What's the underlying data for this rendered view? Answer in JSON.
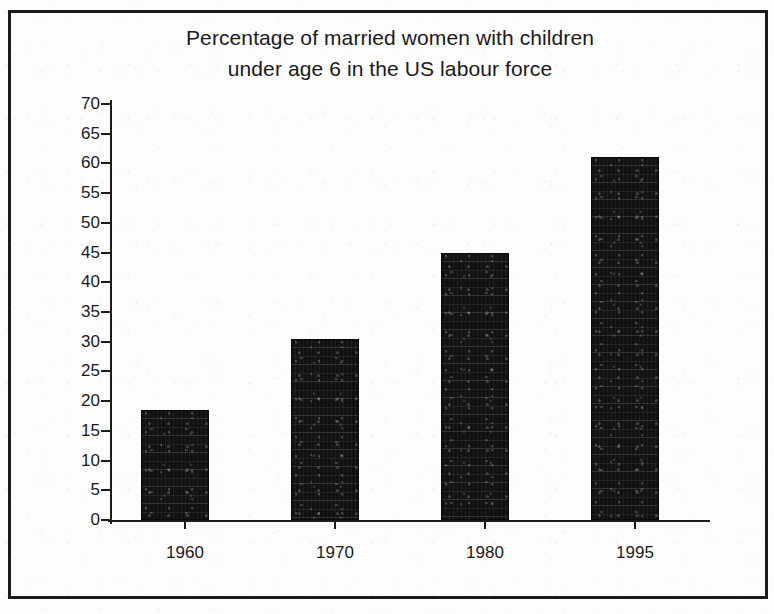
{
  "chart_data": {
    "type": "bar",
    "title": "Percentage of married women with children under age 6 in the US labour force",
    "title_lines": [
      "Percentage of married women with children",
      "under age 6 in the US labour force"
    ],
    "categories": [
      "1960",
      "1970",
      "1980",
      "1995"
    ],
    "values": [
      18.5,
      30.5,
      45,
      61
    ],
    "xlabel": "",
    "ylabel": "",
    "ylim": [
      0,
      70
    ],
    "ytick_step": 5,
    "ytick_labels": [
      "70",
      "65",
      "60",
      "55",
      "50",
      "45",
      "40",
      "35",
      "30",
      "25",
      "20",
      "15",
      "10",
      "5",
      "0"
    ],
    "grid": false,
    "legend": false,
    "series": [
      {
        "name": "Percentage in labour force",
        "values": [
          18.5,
          30.5,
          45,
          61
        ]
      }
    ],
    "bar_color": "#111111",
    "axis_color": "#1b1b1b",
    "background_color": "#fdfdfd"
  },
  "figure": {
    "frame_border_color": "#1c1c1c"
  }
}
